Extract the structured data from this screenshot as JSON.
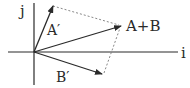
{
  "diagram": {
    "title": "",
    "type": "vector-addition-parallelogram",
    "axes": {
      "x_label": "i",
      "y_label": "j"
    },
    "vectors": [
      {
        "id": "a_prime",
        "label": "A′",
        "from": [
          34,
          52
        ],
        "to": [
          53,
          6
        ]
      },
      {
        "id": "a_plus_b",
        "label": "A+B",
        "from": [
          34,
          52
        ],
        "to": [
          121,
          26
        ]
      },
      {
        "id": "b_prime",
        "label": "B′",
        "from": [
          34,
          52
        ],
        "to": [
          102,
          74
        ]
      }
    ],
    "dashed_lines": [
      {
        "from": [
          53,
          6
        ],
        "to": [
          121,
          26
        ]
      },
      {
        "from": [
          102,
          74
        ],
        "to": [
          121,
          26
        ]
      }
    ],
    "colors": {
      "line": "#2a2a2a",
      "dashed": "#7a7a7a",
      "background": "#ffffff"
    }
  }
}
